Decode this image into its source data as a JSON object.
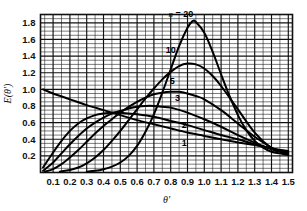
{
  "chart_data": {
    "type": "line",
    "title": "",
    "xlabel": "θ'",
    "ylabel": "E(θ')",
    "xlim": [
      0.025,
      1.525
    ],
    "ylim": [
      0.0,
      1.9
    ],
    "grid": true,
    "grid_minor_x": 0.05,
    "grid_minor_y": 0.05,
    "grid_major_x": 0.1,
    "grid_major_y": 0.2,
    "legend": "inline-curve-labels",
    "legend_title": "n",
    "xticks": [
      "0.1",
      "0.2",
      "0.3",
      "0.4",
      "0.5",
      "0.6",
      "0.7",
      "0.8",
      "0.9",
      "1.0",
      "1.1",
      "1.2",
      "1.3",
      "1.4",
      "1.5"
    ],
    "xtick_values": [
      0.1,
      0.2,
      0.3,
      0.4,
      0.5,
      0.6,
      0.7,
      0.8,
      0.9,
      1.0,
      1.1,
      1.2,
      1.3,
      1.4,
      1.5
    ],
    "yticks": [
      "0.2",
      "0.4",
      "0.6",
      "0.8",
      "1.0",
      "1.2",
      "1.4",
      "1.6",
      "1.8"
    ],
    "ytick_values": [
      0.2,
      0.4,
      0.6,
      0.8,
      1.0,
      1.2,
      1.4,
      1.6,
      1.8
    ],
    "annotations": [
      {
        "text": "n = 20",
        "x": 0.86,
        "y": 1.87,
        "italic_prefix": "n",
        "curve": "20"
      },
      {
        "text": "10",
        "x": 0.8,
        "y": 1.44,
        "curve": "10"
      },
      {
        "text": "5",
        "x": 0.81,
        "y": 1.06,
        "curve": "5"
      },
      {
        "text": "3",
        "x": 0.84,
        "y": 0.86,
        "curve": "3"
      },
      {
        "text": "2",
        "x": 0.88,
        "y": 0.53,
        "curve": "2"
      },
      {
        "text": "1",
        "x": 0.88,
        "y": 0.32,
        "curve": "1"
      }
    ],
    "series": [
      {
        "name": "1",
        "x": [
          0.04,
          0.1,
          0.2,
          0.3,
          0.4,
          0.5,
          0.6,
          0.7,
          0.8,
          0.9,
          1.0,
          1.1,
          1.2,
          1.3,
          1.4,
          1.45,
          1.5
        ],
        "values": [
          1.0,
          0.95,
          0.88,
          0.81,
          0.75,
          0.69,
          0.63,
          0.58,
          0.53,
          0.48,
          0.44,
          0.4,
          0.36,
          0.33,
          0.29,
          0.27,
          0.26
        ]
      },
      {
        "name": "2",
        "x": [
          0.04,
          0.1,
          0.15,
          0.2,
          0.25,
          0.3,
          0.35,
          0.4,
          0.45,
          0.5,
          0.6,
          0.7,
          0.8,
          0.9,
          1.0,
          1.1,
          1.2,
          1.3,
          1.4,
          1.45,
          1.5
        ],
        "values": [
          0.06,
          0.24,
          0.38,
          0.5,
          0.59,
          0.65,
          0.69,
          0.71,
          0.72,
          0.72,
          0.7,
          0.67,
          0.62,
          0.57,
          0.51,
          0.45,
          0.4,
          0.34,
          0.29,
          0.27,
          0.25
        ]
      },
      {
        "name": "3",
        "x": [
          0.04,
          0.1,
          0.15,
          0.2,
          0.25,
          0.3,
          0.35,
          0.4,
          0.45,
          0.5,
          0.55,
          0.6,
          0.65,
          0.7,
          0.75,
          0.8,
          0.9,
          1.0,
          1.1,
          1.2,
          1.3,
          1.4,
          1.45,
          1.5
        ],
        "values": [
          0.02,
          0.12,
          0.23,
          0.34,
          0.44,
          0.53,
          0.6,
          0.66,
          0.71,
          0.74,
          0.77,
          0.79,
          0.8,
          0.8,
          0.79,
          0.78,
          0.72,
          0.64,
          0.55,
          0.45,
          0.36,
          0.28,
          0.26,
          0.24
        ]
      },
      {
        "name": "5",
        "x": [
          0.05,
          0.1,
          0.15,
          0.2,
          0.25,
          0.3,
          0.35,
          0.4,
          0.45,
          0.5,
          0.55,
          0.6,
          0.65,
          0.7,
          0.75,
          0.8,
          0.85,
          0.9,
          0.95,
          1.0,
          1.1,
          1.2,
          1.3,
          1.4,
          1.45,
          1.5
        ],
        "values": [
          0.01,
          0.04,
          0.1,
          0.18,
          0.27,
          0.37,
          0.47,
          0.56,
          0.64,
          0.72,
          0.79,
          0.85,
          0.9,
          0.94,
          0.96,
          0.97,
          0.97,
          0.95,
          0.92,
          0.88,
          0.75,
          0.59,
          0.43,
          0.3,
          0.26,
          0.23
        ]
      },
      {
        "name": "10",
        "x": [
          0.14,
          0.2,
          0.25,
          0.3,
          0.35,
          0.4,
          0.45,
          0.5,
          0.55,
          0.6,
          0.65,
          0.7,
          0.75,
          0.8,
          0.85,
          0.9,
          0.95,
          1.0,
          1.05,
          1.1,
          1.2,
          1.3,
          1.4,
          1.45,
          1.5
        ],
        "values": [
          0.01,
          0.03,
          0.06,
          0.11,
          0.18,
          0.27,
          0.38,
          0.5,
          0.63,
          0.76,
          0.89,
          1.01,
          1.12,
          1.21,
          1.28,
          1.31,
          1.3,
          1.25,
          1.16,
          1.04,
          0.76,
          0.48,
          0.29,
          0.25,
          0.22
        ]
      },
      {
        "name": "20",
        "x": [
          0.3,
          0.35,
          0.4,
          0.45,
          0.5,
          0.55,
          0.6,
          0.65,
          0.7,
          0.75,
          0.8,
          0.85,
          0.9,
          0.93,
          0.95,
          1.0,
          1.05,
          1.1,
          1.15,
          1.2,
          1.25,
          1.3,
          1.35,
          1.4,
          1.45,
          1.5
        ],
        "values": [
          0.01,
          0.02,
          0.04,
          0.07,
          0.12,
          0.2,
          0.32,
          0.49,
          0.7,
          0.96,
          1.24,
          1.52,
          1.74,
          1.82,
          1.81,
          1.68,
          1.45,
          1.18,
          0.92,
          0.69,
          0.51,
          0.38,
          0.3,
          0.25,
          0.23,
          0.21
        ]
      }
    ]
  }
}
